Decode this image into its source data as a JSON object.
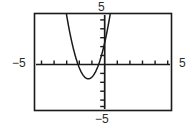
{
  "figure": {
    "kind": "graphing-calculator-window",
    "background_color": "#ffffff",
    "stroke_color": "#1a1a1a"
  },
  "labels": {
    "top": "5",
    "bottom": "−5",
    "left": "−5",
    "right": "5"
  },
  "chart_data": {
    "type": "line",
    "title": "",
    "xlabel": "",
    "ylabel": "",
    "xlim": [
      -5,
      5
    ],
    "ylim": [
      -5,
      5
    ],
    "grid": false,
    "legend": "none",
    "x_tick_labels": [
      "−5",
      "5"
    ],
    "y_tick_labels": [
      "5",
      "−5"
    ],
    "x_tick_step": 1,
    "y_tick_step": 1,
    "axis_tick_count_x": 10,
    "axis_tick_count_y": 10,
    "annotations": [],
    "series": [
      {
        "name": "parabola",
        "equation": "y = 2.4(x + 1.3)^2 - 1.6",
        "vertex": [
          -1.3,
          -1.6
        ],
        "opens": "up",
        "x_intercepts": [
          -2.12,
          -0.48
        ],
        "x": [
          -2.8,
          -2.6,
          -2.4,
          -2.2,
          -2.0,
          -1.8,
          -1.6,
          -1.4,
          -1.3,
          -1.2,
          -1.0,
          -0.8,
          -0.6,
          -0.4,
          -0.2,
          0.0,
          0.2,
          0.4,
          0.6,
          0.8
        ],
        "values": [
          3.8,
          2.54,
          1.46,
          0.56,
          -0.42,
          -1.0,
          -1.38,
          -1.58,
          -1.6,
          -1.58,
          -1.38,
          -1.0,
          -0.42,
          0.34,
          1.3,
          2.46,
          3.8,
          5.34,
          7.1,
          9.0
        ]
      }
    ]
  }
}
